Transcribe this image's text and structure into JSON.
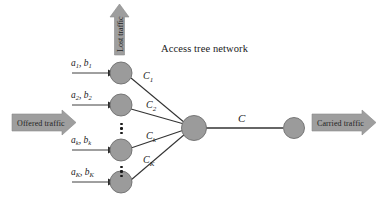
{
  "figure": {
    "title": "Access tree network",
    "background_color": "#ffffff",
    "node_fill": "#9b9b9b",
    "node_stroke": "#6e6e6e",
    "line_color": "#333333",
    "banner_fill": "#9e9e9e"
  },
  "banners": {
    "offered": "Offered traffic",
    "carried": "Carried traffic",
    "lost": "Lost traffic"
  },
  "access_nodes": [
    {
      "input_label_a": "a",
      "input_label_a_sub": "1",
      "input_label_b": "b",
      "input_label_b_sub": "1",
      "separator": ", ",
      "edge_label": "C",
      "edge_label_sub": "1"
    },
    {
      "input_label_a": "a",
      "input_label_a_sub": "2",
      "input_label_b": "b",
      "input_label_b_sub": "2",
      "separator": ", ",
      "edge_label": "C",
      "edge_label_sub": "2"
    },
    {
      "input_label_a": "a",
      "input_label_a_sub": "k",
      "input_label_b": "b",
      "input_label_b_sub": "k",
      "separator": ", ",
      "edge_label": "C",
      "edge_label_sub": "k"
    },
    {
      "input_label_a": "a",
      "input_label_a_sub": "K",
      "input_label_b": "b",
      "input_label_b_sub": "K",
      "separator": ", ",
      "edge_label": "C",
      "edge_label_sub": "K"
    }
  ],
  "trunk": {
    "capacity_label": "C"
  },
  "ellipsis": {
    "glyph": "⋮"
  }
}
